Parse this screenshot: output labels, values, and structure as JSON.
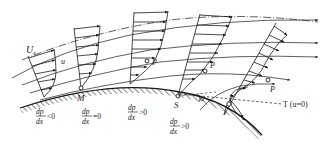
{
  "diagram": {
    "colors": {
      "ink": "#1a1a1a",
      "background": "#ffffff"
    },
    "labels": {
      "free_stream_velocity": "U",
      "free_stream_subscript": "e",
      "local_velocity": "u",
      "point_M": "M",
      "point_S": "S",
      "inflection_P1": "P",
      "inflection_P2": "P",
      "inflection_P3": "P",
      "angle": "α",
      "zero_velocity_line": "T (u=0)"
    },
    "pressure_gradients": [
      {
        "num": "dp",
        "den": "dx",
        "relation": "<0"
      },
      {
        "num": "dp",
        "den": "dx",
        "relation": "=0"
      },
      {
        "num": "dp",
        "den": "dx",
        "relation": ">0"
      },
      {
        "num": "dp",
        "den": "dx",
        "relation": ">0"
      }
    ],
    "profiles": [
      {
        "id": "favorable",
        "location": "upstream"
      },
      {
        "id": "minimum-pressure",
        "location": "M"
      },
      {
        "id": "adverse",
        "location": "P"
      },
      {
        "id": "separation",
        "location": "S"
      },
      {
        "id": "reversed",
        "location": "downstream"
      }
    ]
  }
}
